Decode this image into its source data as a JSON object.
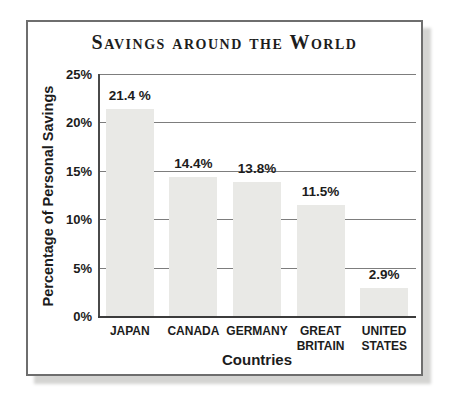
{
  "chart_data": {
    "type": "bar",
    "title": "Savings around the World",
    "xlabel": "Countries",
    "ylabel": "Percentage of Personal Savings",
    "categories": [
      "JAPAN",
      "CANADA",
      "GERMANY",
      "GREAT\nBRITAIN",
      "UNITED\nSTATES"
    ],
    "values": [
      21.4,
      14.4,
      13.8,
      11.5,
      2.9
    ],
    "value_labels": [
      "21.4 %",
      "14.4%",
      "13.8%",
      "11.5%",
      "2.9%"
    ],
    "ylim": [
      0,
      25
    ],
    "ytick_step": 5,
    "ytick_labels": [
      "25%",
      "20%",
      "15%",
      "10%",
      "5%",
      "0%"
    ],
    "grid": true,
    "legend": "none",
    "colors": {
      "bar": "#e9e9e6",
      "gridline": "#7d7d7d",
      "axis": "#3c3c3c",
      "text": "#1c1c1c",
      "frame_border": "#6e6e6e",
      "shadow": "#d4d4d2",
      "background": "#ffffff"
    }
  }
}
